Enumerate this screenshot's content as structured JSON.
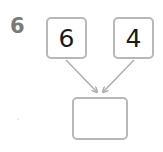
{
  "question": {
    "number": "6"
  },
  "inputs": [
    {
      "value": "6"
    },
    {
      "value": "4"
    }
  ],
  "answer": {
    "value": ""
  },
  "colors": {
    "border": "#b8b8b8",
    "arrow": "#b0b0b0",
    "label": "#7a7a7a",
    "text": "#1a1a1a"
  }
}
